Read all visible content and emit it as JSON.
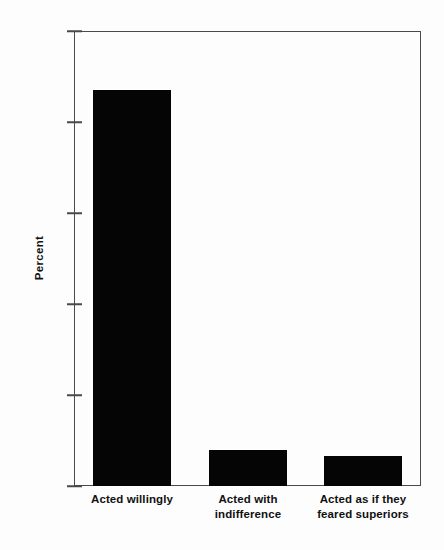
{
  "chart_data": {
    "type": "bar",
    "title": "",
    "subtitle": "",
    "xlabel": "",
    "ylabel": "Percent",
    "ylim": [
      0,
      100
    ],
    "yticks": [
      0,
      20,
      40,
      60,
      80,
      100
    ],
    "ytick_labels": [
      "0",
      "20",
      "40",
      "60",
      "80",
      "100"
    ],
    "grid": false,
    "legend": false,
    "legend_position": "none",
    "bar_color": "#050505",
    "axis_color": "#4a4a4a",
    "background_color": "#fdfdfd",
    "categories": [
      "Acted willingly",
      "Acted with indifference",
      "Acted as if they feared superiors"
    ],
    "category_lines": [
      [
        "Acted willingly"
      ],
      [
        "Acted with",
        "indifference"
      ],
      [
        "Acted as if they",
        "feared superiors"
      ]
    ],
    "values": [
      87,
      8,
      6.5
    ],
    "value_labels": [
      "87",
      "8",
      "6.5"
    ]
  }
}
